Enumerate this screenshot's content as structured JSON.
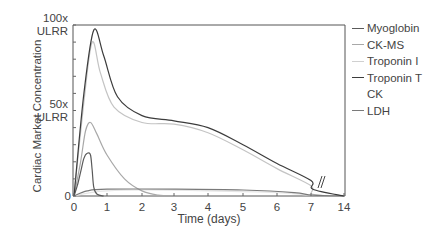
{
  "chart_data": {
    "type": "line",
    "title": "",
    "xlabel": "Time (days)",
    "ylabel": "Cardiac Market Concentration",
    "x_ticks": [
      "0",
      "1",
      "2",
      "3",
      "4",
      "5",
      "6",
      "7",
      "14"
    ],
    "y_ticks": [
      {
        "label_line1": "100x",
        "label_line2": "ULRR",
        "value": 100
      },
      {
        "label_line1": "50x",
        "label_line2": "ULRR",
        "value": 50
      },
      {
        "label_line1": "0",
        "label_line2": "",
        "value": 0
      }
    ],
    "ylim": [
      0,
      100
    ],
    "grid": false,
    "legend_position": "right",
    "axis_break": {
      "between": [
        "7",
        "14"
      ],
      "glyph": "//"
    },
    "series": [
      {
        "name": "Myoglobin",
        "color": "#5a5a5a",
        "points": [
          [
            0,
            0
          ],
          [
            0.1,
            6
          ],
          [
            0.2,
            14
          ],
          [
            0.3,
            22
          ],
          [
            0.4,
            25
          ],
          [
            0.5,
            24
          ],
          [
            0.55,
            15
          ],
          [
            0.6,
            5
          ],
          [
            0.7,
            1
          ],
          [
            0.9,
            0
          ]
        ]
      },
      {
        "name": "CK-MS",
        "color": "#a8a8a8",
        "points": [
          [
            0,
            0
          ],
          [
            0.2,
            20
          ],
          [
            0.35,
            38
          ],
          [
            0.5,
            43
          ],
          [
            0.7,
            36
          ],
          [
            1.0,
            24
          ],
          [
            1.5,
            10
          ],
          [
            2.0,
            3
          ],
          [
            2.5,
            0.5
          ],
          [
            3,
            0
          ]
        ]
      },
      {
        "name": "Troponin I",
        "color": "#c4c4c4",
        "points": [
          [
            0,
            0
          ],
          [
            0.3,
            55
          ],
          [
            0.55,
            90
          ],
          [
            0.8,
            72
          ],
          [
            1.2,
            52
          ],
          [
            2,
            43
          ],
          [
            3,
            42
          ],
          [
            4,
            37
          ],
          [
            5,
            27
          ],
          [
            6,
            16
          ],
          [
            7,
            6
          ],
          [
            7.4,
            1
          ],
          [
            14,
            0
          ]
        ]
      },
      {
        "name": "Troponin T",
        "color": "#3c3c3c",
        "points": [
          [
            0,
            0
          ],
          [
            0.3,
            60
          ],
          [
            0.6,
            97
          ],
          [
            0.9,
            82
          ],
          [
            1.3,
            58
          ],
          [
            2,
            47
          ],
          [
            3,
            44
          ],
          [
            4,
            40
          ],
          [
            5,
            30
          ],
          [
            6,
            19
          ],
          [
            7,
            9
          ],
          [
            7.4,
            4
          ],
          [
            14,
            0
          ]
        ]
      },
      {
        "name": "CK",
        "color": "#e6e6e6",
        "points": [
          [
            0,
            0
          ],
          [
            0.5,
            2
          ],
          [
            1,
            3
          ],
          [
            2,
            3.5
          ],
          [
            4,
            3
          ],
          [
            6,
            2
          ],
          [
            7.2,
            0.5
          ],
          [
            14,
            0
          ]
        ]
      },
      {
        "name": "LDH",
        "color": "#7a7a7a",
        "points": [
          [
            0,
            0
          ],
          [
            0.4,
            3
          ],
          [
            1,
            4
          ],
          [
            3,
            4
          ],
          [
            5,
            3.5
          ],
          [
            6.5,
            2
          ],
          [
            7.3,
            0.5
          ],
          [
            14,
            0
          ]
        ]
      }
    ]
  },
  "legend": {
    "items": [
      {
        "label": "Myoglobin",
        "color": "#5a5a5a"
      },
      {
        "label": "CK-MS",
        "color": "#a8a8a8"
      },
      {
        "label": "Troponin I",
        "color": "#d0d0d0"
      },
      {
        "label": "Troponin T",
        "color": "#3c3c3c"
      },
      {
        "label": "CK",
        "color": "#ffffff"
      },
      {
        "label": "LDH",
        "color": "#7a7a7a"
      }
    ]
  }
}
